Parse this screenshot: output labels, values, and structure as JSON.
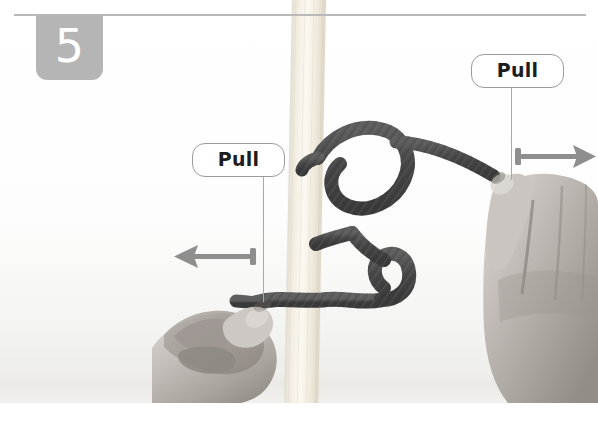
{
  "page": {
    "width": 598,
    "height": 427
  },
  "step": {
    "number": "5",
    "badge_color": "#b5b5b5",
    "badge_text_color": "#ffffff",
    "rule_color": "#b9b9b9"
  },
  "callouts": [
    {
      "id": "pull-left",
      "label": "Pull",
      "border_color": "#9b9b9b",
      "text_color": "#1d1d1d",
      "background": "#ffffff",
      "leader_color": "#a9a9a9"
    },
    {
      "id": "pull-right",
      "label": "Pull",
      "border_color": "#9b9b9b",
      "text_color": "#1d1d1d",
      "background": "#ffffff",
      "leader_color": "#a9a9a9"
    }
  ],
  "arrows": [
    {
      "id": "arrow-left",
      "direction": "left",
      "color": "#8e8e8e"
    },
    {
      "id": "arrow-right",
      "direction": "right",
      "color": "#8e8e8e"
    }
  ],
  "scene": {
    "post_label": "wooden post",
    "post_color": "#f7f3e9",
    "rope_label": "rope knot",
    "rope_color": "#4a4a4a",
    "rope_highlight": "#6d6d6d",
    "hand_left_label": "left hand gripping rope end",
    "hand_right_label": "right hand gripping rope standing part",
    "skin_color": "#b9b4b0",
    "background_color": "#ffffff"
  }
}
